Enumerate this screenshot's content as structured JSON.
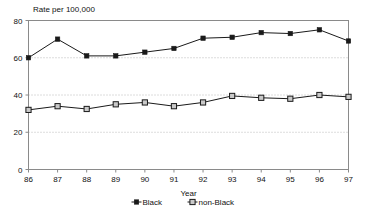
{
  "chart_data": {
    "type": "line",
    "title": "Rate per 100,000",
    "xlabel": "Year",
    "ylabel": "",
    "categories": [
      "86",
      "87",
      "88",
      "89",
      "90",
      "91",
      "92",
      "93",
      "94",
      "95",
      "96",
      "97"
    ],
    "x": [
      86,
      87,
      88,
      89,
      90,
      91,
      92,
      93,
      94,
      95,
      96,
      97
    ],
    "series": [
      {
        "name": "Black",
        "marker": "filled-square",
        "color": "#000000",
        "values": [
          60.0,
          70.0,
          61.0,
          61.0,
          63.0,
          65.0,
          70.5,
          71.0,
          73.5,
          73.0,
          75.0,
          69.0
        ]
      },
      {
        "name": "non-Black",
        "marker": "open-square",
        "color": "#000000",
        "values": [
          32.0,
          34.0,
          32.5,
          35.0,
          36.0,
          34.0,
          36.0,
          39.5,
          38.5,
          38.0,
          40.0,
          39.0
        ]
      }
    ],
    "ylim": [
      0,
      80
    ],
    "yticks": [
      0,
      20,
      40,
      60,
      80
    ],
    "ytick_labels": [
      "0",
      "20",
      "40",
      "60",
      "80"
    ],
    "xlim": [
      86,
      97
    ],
    "grid": "horizontal-dotted",
    "legend_position": "bottom-center"
  },
  "legend": {
    "items": [
      {
        "label": "Black",
        "marker": "filled-square"
      },
      {
        "label": "non-Black",
        "marker": "open-square"
      }
    ]
  },
  "colors": {
    "line": "#1a1a1a",
    "frame": "#8a8a8a",
    "gridline": "#b9b9b9",
    "marker_fill_open": "#c9c9c9",
    "background": "#ffffff"
  }
}
